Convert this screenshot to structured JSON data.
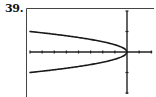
{
  "problem": {
    "number_label": "39."
  },
  "colors": {
    "axis": "#222222",
    "curve": "#1a1a1a",
    "frame": "#444444",
    "background": "#ffffff"
  },
  "chart_data": {
    "type": "line",
    "title": "",
    "xlabel": "",
    "ylabel": "",
    "xlim": [
      -8,
      2
    ],
    "ylim": [
      -2,
      2
    ],
    "xscale": 1,
    "yscale": 1,
    "grid": false,
    "legend": null,
    "equation_estimate": "x = -8y^2  (y = ±sqrt(-x/8))",
    "series": [
      {
        "name": "upper branch",
        "x": [
          -8,
          -6,
          -4,
          -3,
          -2,
          -1,
          -0.5,
          0
        ],
        "y": [
          1.0,
          0.87,
          0.71,
          0.61,
          0.5,
          0.35,
          0.25,
          0
        ]
      },
      {
        "name": "lower branch",
        "x": [
          -8,
          -6,
          -4,
          -3,
          -2,
          -1,
          -0.5,
          0
        ],
        "y": [
          -1.0,
          -0.87,
          -0.71,
          -0.61,
          -0.5,
          -0.35,
          -0.25,
          0
        ]
      }
    ],
    "x_ticks": [
      -8,
      -7,
      -6,
      -5,
      -4,
      -3,
      -2,
      -1,
      0,
      1,
      2
    ],
    "y_ticks": [
      -2,
      -1,
      0,
      1,
      2
    ]
  }
}
